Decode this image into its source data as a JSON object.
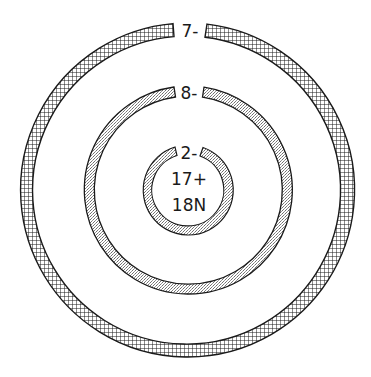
{
  "diagram": {
    "center": [
      188,
      190
    ],
    "colors": {
      "stroke": "#1a1a1a",
      "background": "#ffffff",
      "stipple": "#8a8a8a"
    },
    "nucleus": {
      "protons": "17+",
      "neutrons": "18N"
    },
    "shells": [
      {
        "name": "inner",
        "electrons": "2-",
        "fill": "stipple",
        "r_outer": 45,
        "r_inner": 36
      },
      {
        "name": "middle",
        "electrons": "8-",
        "fill": "stipple",
        "r_outer": 104,
        "r_inner": 94
      },
      {
        "name": "outer",
        "electrons": "7-",
        "fill": "crosshatch",
        "r_outer": 167,
        "r_inner": 154
      }
    ]
  }
}
